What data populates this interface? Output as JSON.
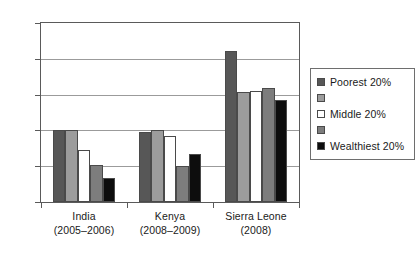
{
  "chart_data": {
    "type": "bar",
    "title": "",
    "subtitle": "",
    "xlabel": "",
    "ylabel": "",
    "ylim": [
      0,
      250
    ],
    "ytick_values": [
      0,
      50,
      100,
      150,
      200,
      250
    ],
    "ytick_labels": [
      "0",
      "50",
      "100",
      "150",
      "200",
      "250"
    ],
    "grid": "horizontal",
    "legend_position": "right",
    "categories": [
      "India (2005–2006)",
      "Kenya (2008–2009)",
      "Sierra Leone (2008)"
    ],
    "category_lines": [
      {
        "line1": "India",
        "line2": "(2005–2006)"
      },
      {
        "line1": "Kenya",
        "line2": "(2008–2009)"
      },
      {
        "line1": "Sierra Leone",
        "line2": "(2008)"
      }
    ],
    "series": [
      {
        "name": "Poorest 20%",
        "label_shown": true,
        "color": "#575757",
        "values": [
          101,
          98,
          211
        ]
      },
      {
        "name": "",
        "label_shown": false,
        "color": "#9c9c9c",
        "values": [
          100,
          101,
          153
        ]
      },
      {
        "name": "Middle 20%",
        "label_shown": true,
        "color": "#ffffff",
        "values": [
          72,
          92,
          155
        ]
      },
      {
        "name": "",
        "label_shown": false,
        "color": "#7d7d7d",
        "values": [
          51,
          50,
          159
        ]
      },
      {
        "name": "Wealthiest 20%",
        "label_shown": true,
        "color": "#0d0d0d",
        "values": [
          33,
          67,
          143
        ]
      }
    ]
  },
  "legend": {
    "entries": [
      {
        "label": "Poorest 20%",
        "color": "#575757"
      },
      {
        "label": "",
        "color": "#9c9c9c"
      },
      {
        "label": "Middle 20%",
        "color": "#ffffff"
      },
      {
        "label": "",
        "color": "#7d7d7d"
      },
      {
        "label": "Wealthiest 20%",
        "color": "#0d0d0d"
      }
    ]
  },
  "axis": {
    "y_labels": [
      "250",
      "200",
      "150",
      "100",
      "50",
      "0"
    ]
  }
}
